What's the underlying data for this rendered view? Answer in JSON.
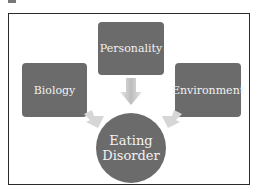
{
  "diagram": {
    "type": "converging-influences",
    "nodes": [
      {
        "id": "personality",
        "label": "Personality"
      },
      {
        "id": "biology",
        "label": "Biology"
      },
      {
        "id": "environment",
        "label": "Environment"
      }
    ],
    "center": {
      "line1": "Eating",
      "line2": "Disorder"
    },
    "colors": {
      "node_fill": "#6b6b6b",
      "text": "#f2f2f2",
      "arrow": "#cfcfcf",
      "frame": "#2a2a2a"
    }
  }
}
